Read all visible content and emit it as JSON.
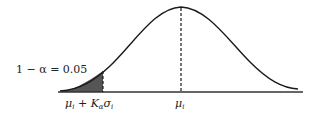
{
  "diagram": {
    "type": "normal-distribution-left-tail",
    "tail_label": "1 − α = 0.05",
    "threshold_label": {
      "mu": "μ",
      "mu_sub": "i",
      "plus": "+",
      "K": "K",
      "K_sub": "α",
      "sigma": "σ",
      "sigma_sub": "i"
    },
    "mean_label": {
      "mu": "μ",
      "mu_sub": "i"
    },
    "colors": {
      "curve": "#1a1a1a",
      "shade": "#555555",
      "axis": "#333333"
    }
  }
}
